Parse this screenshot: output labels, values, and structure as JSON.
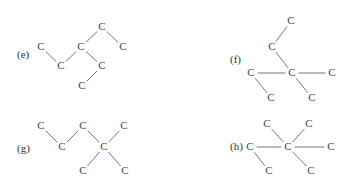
{
  "figure": {
    "background_color": "#ffffff",
    "atom_color": "#444444",
    "bond_color": "#777777",
    "label_color": "#333333",
    "width": 343,
    "height": 192,
    "atom_symbol": "C"
  },
  "structures": [
    {
      "id": "e",
      "label": "(e)",
      "label_x": 17,
      "label_y": 55,
      "atoms": [
        {
          "name": "atom-e-1",
          "symbol": "C",
          "x": 41,
          "y": 47
        },
        {
          "name": "atom-e-2",
          "symbol": "C",
          "x": 61,
          "y": 66
        },
        {
          "name": "atom-e-3",
          "symbol": "C",
          "x": 81,
          "y": 47
        },
        {
          "name": "atom-e-4",
          "symbol": "C",
          "x": 102,
          "y": 27
        },
        {
          "name": "atom-e-5",
          "symbol": "C",
          "x": 123,
          "y": 47
        },
        {
          "name": "atom-e-6",
          "symbol": "C",
          "x": 102,
          "y": 66
        },
        {
          "name": "atom-e-7",
          "symbol": "C",
          "x": 82,
          "y": 86
        }
      ],
      "bonds": [
        {
          "name": "bond-e-1-2",
          "from": 0,
          "to": 1
        },
        {
          "name": "bond-e-2-3",
          "from": 1,
          "to": 2
        },
        {
          "name": "bond-e-3-4",
          "from": 2,
          "to": 3
        },
        {
          "name": "bond-e-4-5",
          "from": 3,
          "to": 4
        },
        {
          "name": "bond-e-3-6",
          "from": 2,
          "to": 5
        },
        {
          "name": "bond-e-6-7",
          "from": 5,
          "to": 6
        }
      ]
    },
    {
      "id": "f",
      "label": "(f)",
      "label_x": 230,
      "label_y": 60,
      "atoms": [
        {
          "name": "atom-f-1",
          "symbol": "C",
          "x": 291,
          "y": 21
        },
        {
          "name": "atom-f-2",
          "symbol": "C",
          "x": 272,
          "y": 47
        },
        {
          "name": "atom-f-3",
          "symbol": "C",
          "x": 292,
          "y": 73
        },
        {
          "name": "atom-f-4",
          "symbol": "C",
          "x": 251,
          "y": 73
        },
        {
          "name": "atom-f-5",
          "symbol": "C",
          "x": 332,
          "y": 73
        },
        {
          "name": "atom-f-6",
          "symbol": "C",
          "x": 271,
          "y": 98
        },
        {
          "name": "atom-f-7",
          "symbol": "C",
          "x": 312,
          "y": 98
        }
      ],
      "bonds": [
        {
          "name": "bond-f-1-2",
          "from": 0,
          "to": 1
        },
        {
          "name": "bond-f-2-3",
          "from": 1,
          "to": 2
        },
        {
          "name": "bond-f-3-4",
          "from": 2,
          "to": 3
        },
        {
          "name": "bond-f-3-5",
          "from": 2,
          "to": 4
        },
        {
          "name": "bond-f-4-6",
          "from": 3,
          "to": 5
        },
        {
          "name": "bond-f-3-7",
          "from": 2,
          "to": 6
        }
      ]
    },
    {
      "id": "g",
      "label": "(g)",
      "label_x": 17,
      "label_y": 149,
      "atoms": [
        {
          "name": "atom-g-1",
          "symbol": "C",
          "x": 41,
          "y": 126
        },
        {
          "name": "atom-g-2",
          "symbol": "C",
          "x": 62,
          "y": 147
        },
        {
          "name": "atom-g-3",
          "symbol": "C",
          "x": 83,
          "y": 126
        },
        {
          "name": "atom-g-4",
          "symbol": "C",
          "x": 104,
          "y": 147
        },
        {
          "name": "atom-g-5",
          "symbol": "C",
          "x": 124,
          "y": 126
        },
        {
          "name": "atom-g-6",
          "symbol": "C",
          "x": 83,
          "y": 171
        },
        {
          "name": "atom-g-7",
          "symbol": "C",
          "x": 125,
          "y": 171
        }
      ],
      "bonds": [
        {
          "name": "bond-g-1-2",
          "from": 0,
          "to": 1
        },
        {
          "name": "bond-g-2-3",
          "from": 1,
          "to": 2
        },
        {
          "name": "bond-g-3-4",
          "from": 2,
          "to": 3
        },
        {
          "name": "bond-g-4-5",
          "from": 3,
          "to": 4
        },
        {
          "name": "bond-g-4-6",
          "from": 3,
          "to": 5
        },
        {
          "name": "bond-g-4-7",
          "from": 3,
          "to": 6
        }
      ]
    },
    {
      "id": "h",
      "label": "(h)",
      "label_x": 230,
      "label_y": 147,
      "atoms": [
        {
          "name": "atom-h-1",
          "symbol": "C",
          "x": 267,
          "y": 124
        },
        {
          "name": "atom-h-2",
          "symbol": "C",
          "x": 309,
          "y": 124
        },
        {
          "name": "atom-h-3",
          "symbol": "C",
          "x": 288,
          "y": 147
        },
        {
          "name": "atom-h-4",
          "symbol": "C",
          "x": 250,
          "y": 147
        },
        {
          "name": "atom-h-5",
          "symbol": "C",
          "x": 331,
          "y": 147
        },
        {
          "name": "atom-h-6",
          "symbol": "C",
          "x": 269,
          "y": 171
        },
        {
          "name": "atom-h-7",
          "symbol": "C",
          "x": 311,
          "y": 171
        }
      ],
      "bonds": [
        {
          "name": "bond-h-1-3",
          "from": 0,
          "to": 2
        },
        {
          "name": "bond-h-2-3",
          "from": 1,
          "to": 2
        },
        {
          "name": "bond-h-3-4",
          "from": 2,
          "to": 3
        },
        {
          "name": "bond-h-3-5",
          "from": 2,
          "to": 4
        },
        {
          "name": "bond-h-4-6",
          "from": 3,
          "to": 5
        },
        {
          "name": "bond-h-3-7",
          "from": 2,
          "to": 6
        }
      ]
    }
  ]
}
